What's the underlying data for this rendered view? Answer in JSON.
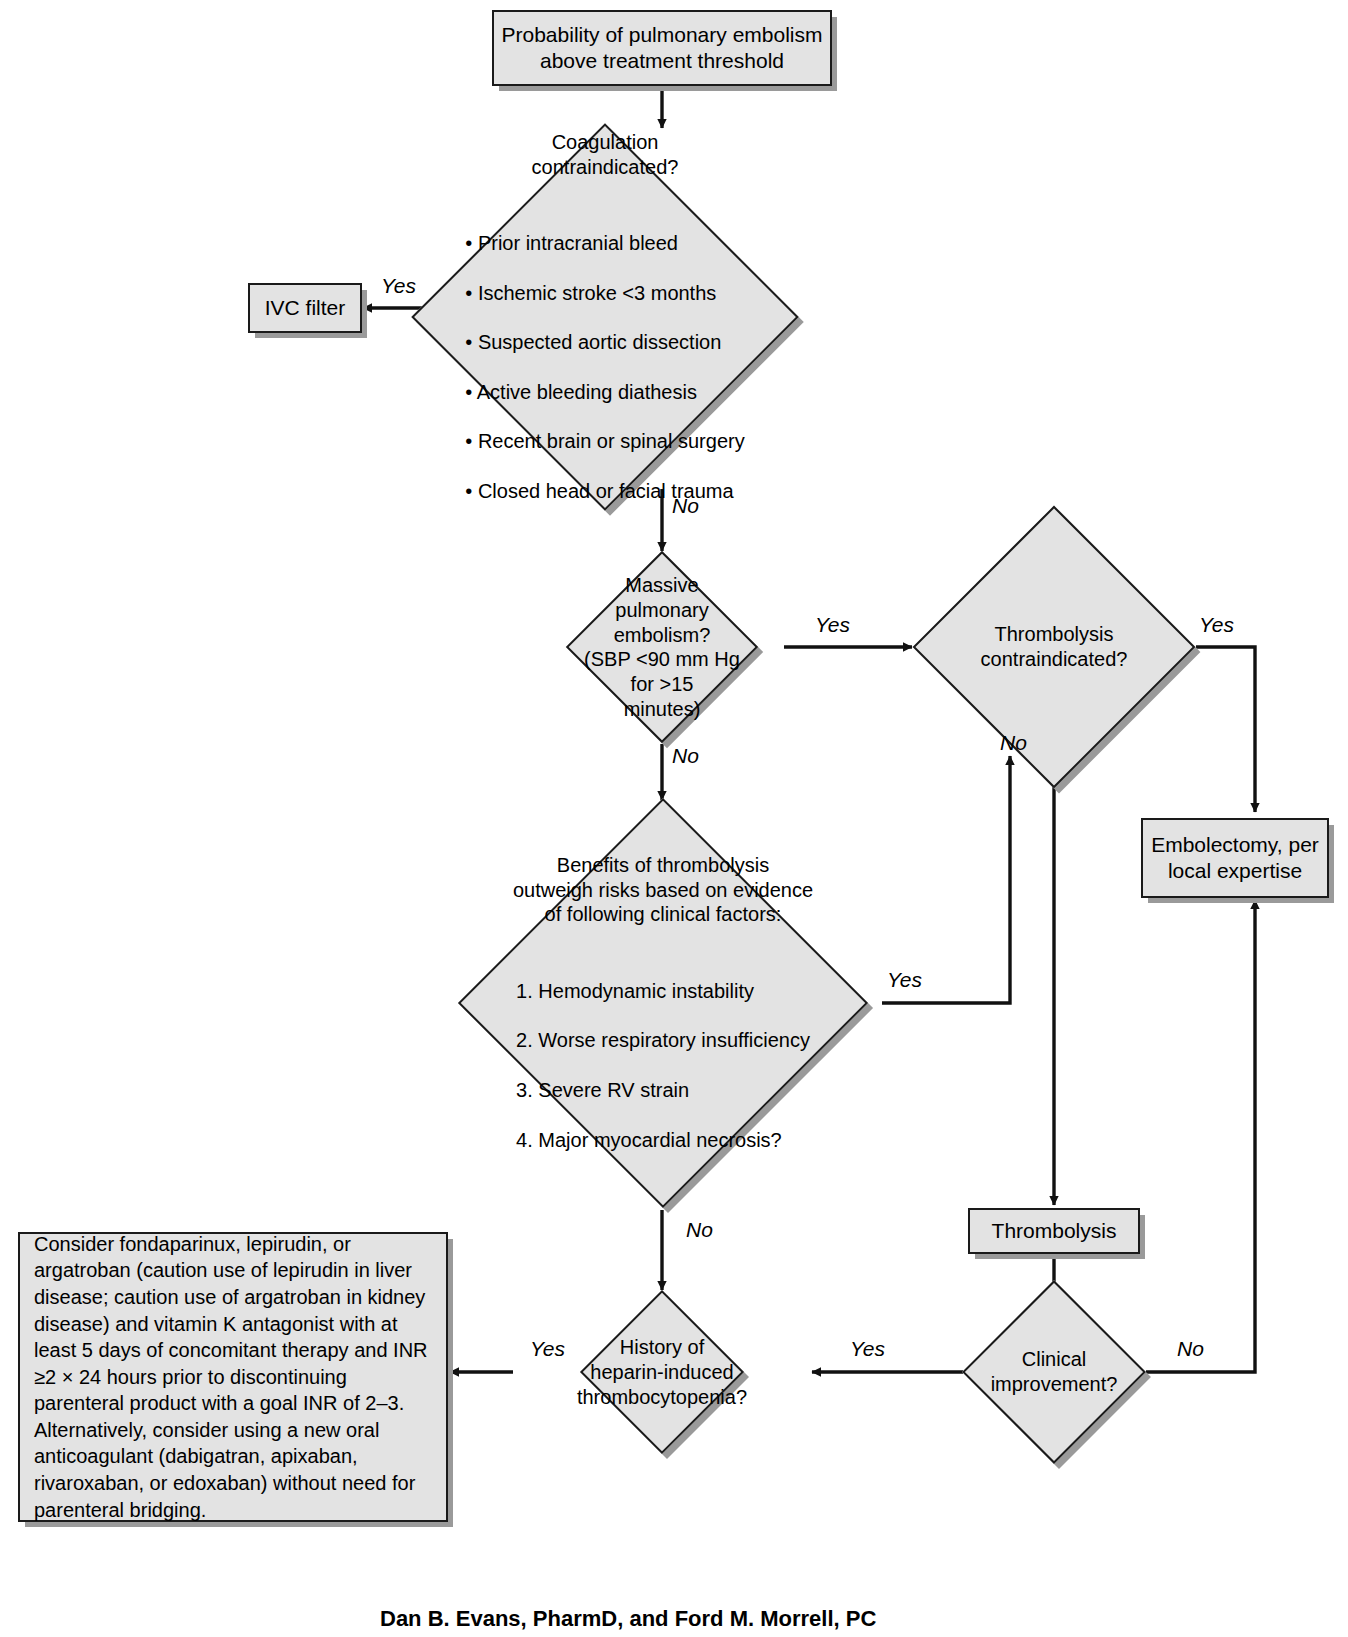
{
  "diagram": {
    "fill_color": "#e3e3e3",
    "stroke_color": "#1a1a1a",
    "shadow_color": "#9a9a9a",
    "background": "#ffffff"
  },
  "nodes": {
    "start": {
      "id": "start",
      "shape": "box",
      "text": "Probability of pulmonary embolism\nabove treatment threshold"
    },
    "coagulation_contraindicated": {
      "id": "coagulation-contraindicated",
      "shape": "diamond",
      "heading": "Coagulation\ncontraindicated?",
      "bullets": [
        "Prior intracranial bleed",
        "Ischemic stroke <3 months",
        "Suspected aortic dissection",
        "Active bleeding diathesis",
        "Recent brain or spinal surgery",
        "Closed head or facial trauma"
      ]
    },
    "ivc_filter": {
      "id": "ivc-filter",
      "shape": "box",
      "text": "IVC filter"
    },
    "massive_pe": {
      "id": "massive-pulmonary-embolism",
      "shape": "diamond",
      "text": "Massive\npulmonary\nembolism?\n(SBP <90 mm Hg\nfor >15\nminutes)"
    },
    "thrombolysis_contraindicated": {
      "id": "thrombolysis-contraindicated",
      "shape": "diamond",
      "text": "Thrombolysis\ncontraindicated?"
    },
    "embolectomy": {
      "id": "embolectomy",
      "shape": "box",
      "text": "Embolectomy, per\nlocal expertise"
    },
    "benefits": {
      "id": "benefits-of-thrombolysis",
      "shape": "diamond",
      "heading": "Benefits of thrombolysis\noutweigh risks based on evidence\nof following clinical factors:",
      "factors": [
        "1. Hemodynamic instability",
        "2. Worse respiratory insufficiency",
        "3. Severe RV strain",
        "4. Major myocardial necrosis?"
      ]
    },
    "thrombolysis": {
      "id": "thrombolysis",
      "shape": "box",
      "text": "Thrombolysis"
    },
    "clinical_improvement": {
      "id": "clinical-improvement",
      "shape": "diamond",
      "text": "Clinical\nimprovement?"
    },
    "hit_history": {
      "id": "history-of-hit",
      "shape": "diamond",
      "text": "History of\nheparin-induced\nthrombocytopenia?"
    },
    "anticoagulation_note": {
      "id": "anticoagulation-note",
      "shape": "box",
      "text": "Consider fondaparinux, lepirudin, or argatroban (caution use of lepirudin in liver disease; caution use of argatroban in kidney disease) and vitamin K antagonist with at least 5 days of concomitant therapy and INR ≥2 × 24 hours prior to discontinuing parenteral product with a goal INR of 2–3. Alternatively, consider using a new oral anticoagulant (dabigatran, apixaban, rivaroxaban, or edoxaban) without need for parenteral bridging."
    }
  },
  "edge_labels": {
    "coag_yes": "Yes",
    "coag_no": "No",
    "massive_yes": "Yes",
    "massive_no": "No",
    "thromb_contra_yes": "Yes",
    "thromb_contra_no": "No",
    "benefits_yes": "Yes",
    "benefits_no": "No",
    "improvement_no": "No",
    "improvement_yes": "Yes",
    "hit_yes": "Yes"
  },
  "caption": {
    "text": "Dan B. Evans, PharmD, and Ford M. Morrell, PC"
  }
}
